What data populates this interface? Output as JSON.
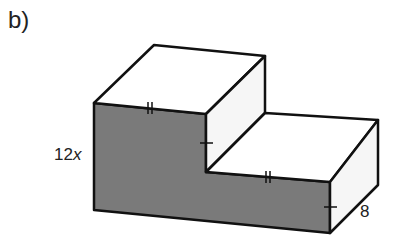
{
  "figure": {
    "part_label": "b)",
    "height_label": {
      "coefficient": "12",
      "variable": "x"
    },
    "depth_label": "8",
    "colors": {
      "front_face": "#7a7a7a",
      "top_faces": "#ffffff",
      "side_faces": "#f6f6f6",
      "edges": "#111111"
    }
  }
}
